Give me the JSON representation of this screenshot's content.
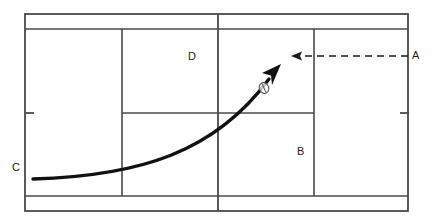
{
  "diagram": {
    "background_color": "#ffffff",
    "line_color": "#4a4a4a",
    "stroke_color": "#1a1a1a",
    "labels": [
      {
        "id": "A",
        "text": "A",
        "x": 415,
        "y": 56,
        "description": "label right of right sideline at dashed arrow height"
      },
      {
        "id": "B",
        "text": "B",
        "x": 300,
        "y": 152,
        "description": "label inside lower right service box"
      },
      {
        "id": "C",
        "text": "C",
        "x": 16,
        "y": 168,
        "description": "label left of left sideline at curve origin height"
      },
      {
        "id": "D",
        "text": "D",
        "x": 192,
        "y": 57,
        "description": "label inside upper left service box"
      }
    ],
    "court": {
      "outer": {
        "x": 25,
        "y": 14,
        "width": 383,
        "height": 197
      },
      "inner_top_line_y": 29,
      "inner_bottom_line_y": 196,
      "inner_left_line_x": 122,
      "center_line_x": 218,
      "inner_right_line_x": 314,
      "service_line_y": 113,
      "service_line_from_x": 122,
      "service_line_to_x": 314,
      "left_tick": {
        "x1": 25,
        "x2": 34,
        "y": 113
      },
      "right_tick": {
        "x1": 400,
        "x2": 409,
        "y": 113
      }
    },
    "dashed_arrow": {
      "from_x": 408,
      "from_y": 56,
      "to_x": 292,
      "to_y": 56,
      "direction": "left",
      "style": "dashed",
      "dash_pattern": "7 5",
      "stroke_width": 1.6
    },
    "curve_arrow": {
      "start": {
        "x": 33,
        "y": 179
      },
      "control1": {
        "x": 140,
        "y": 176
      },
      "control2": {
        "x": 215,
        "y": 150
      },
      "end": {
        "x": 271,
        "y": 77
      },
      "arrow_tip": {
        "x": 279,
        "y": 66
      },
      "stroke_width": 3.4,
      "description": "thick curved trajectory rising from left baseline to upper middle"
    },
    "ball_marker": {
      "x": 264,
      "y": 88,
      "rx": 4.5,
      "ry": 5.5,
      "rotation": -25,
      "description": "small open circle marker on the curve"
    }
  }
}
